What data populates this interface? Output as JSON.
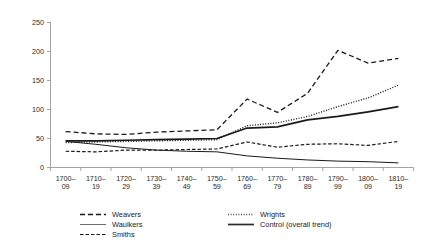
{
  "chart_data": {
    "type": "line",
    "title": "",
    "subtitle": "",
    "xlabel": "",
    "ylabel": "",
    "xlim": [
      0,
      12
    ],
    "ylim": [
      0,
      250
    ],
    "ytick_values": [
      0,
      50,
      100,
      150,
      200,
      250
    ],
    "ytick_labels": [
      "0",
      "50",
      "100",
      "150",
      "200",
      "250"
    ],
    "grid": false,
    "legend_position": "below-plot",
    "categories": [
      "1700–09",
      "1710–19",
      "1720–29",
      "1730–39",
      "1740–49",
      "1750–59",
      "1760–69",
      "1770–79",
      "1780–89",
      "1790–99",
      "1800–09",
      "1810–19"
    ],
    "category_lines": [
      [
        "1700–",
        "09"
      ],
      [
        "1710–",
        "19"
      ],
      [
        "1720–",
        "29"
      ],
      [
        "1730–",
        "39"
      ],
      [
        "1740–",
        "49"
      ],
      [
        "1750–",
        "59"
      ],
      [
        "1760–",
        "69"
      ],
      [
        "1770–",
        "79"
      ],
      [
        "1780–",
        "89"
      ],
      [
        "1790–",
        "99"
      ],
      [
        "1800–",
        "09"
      ],
      [
        "1810–",
        "19"
      ]
    ],
    "series": [
      {
        "name": "Weavers",
        "style": "dashed",
        "dasharray": "5,3",
        "width": 1.3,
        "color": "#1a1a1a",
        "values": [
          62,
          58,
          57,
          61,
          63,
          65,
          118,
          95,
          128,
          202,
          180,
          188
        ]
      },
      {
        "name": "Waulkers",
        "style": "solid-thin",
        "dasharray": "",
        "width": 1.0,
        "color": "#6e6e6e",
        "values": [
          45,
          40,
          34,
          30,
          28,
          27,
          20,
          16,
          13,
          11,
          10,
          8
        ]
      },
      {
        "name": "Smiths",
        "style": "short-dashed",
        "dasharray": "3.5,2",
        "width": 1.2,
        "color": "#1a1a1a",
        "values": [
          28,
          27,
          30,
          30,
          31,
          32,
          44,
          35,
          40,
          41,
          38,
          45
        ]
      },
      {
        "name": "Wrights",
        "style": "dotted",
        "dasharray": "1,1.6",
        "width": 1.4,
        "color": "#4d4d4d",
        "values": [
          43,
          44,
          45,
          46,
          47,
          48,
          72,
          77,
          88,
          105,
          120,
          142
        ]
      },
      {
        "name": "Control (overall trend)",
        "style": "solid-thick",
        "dasharray": "",
        "width": 1.7,
        "color": "#2b2b2b",
        "values": [
          46,
          46,
          47,
          48,
          49,
          50,
          68,
          70,
          82,
          88,
          96,
          105
        ]
      }
    ],
    "legend": [
      {
        "label": "Weavers",
        "style": "dashed",
        "dasharray": "5,3",
        "width": 1.3,
        "color": "#1a1a1a"
      },
      {
        "label": "Waulkers",
        "style": "solid-thin",
        "dasharray": "",
        "width": 1.0,
        "color": "#6e6e6e"
      },
      {
        "label": "Smiths",
        "style": "short-dashed",
        "dasharray": "3.5,2",
        "width": 1.2,
        "color": "#1a1a1a"
      },
      {
        "label": "Wrights",
        "style": "dotted",
        "dasharray": "1,1.6",
        "width": 1.4,
        "color": "#4d4d4d"
      },
      {
        "label": "Control (overall trend)",
        "style": "solid-thick",
        "dasharray": "",
        "width": 1.7,
        "color": "#2b2b2b"
      }
    ],
    "colors": {
      "axis": "#8d8d8d",
      "text": "#1a1a1a",
      "background": "#ffffff"
    }
  }
}
